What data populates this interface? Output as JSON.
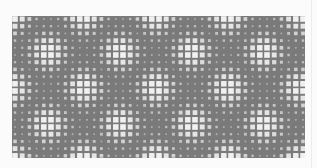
{
  "image": {
    "subject": "moire-dot-pattern",
    "description": "Grid of light dots on gray background forming diamond interference pattern",
    "colors": {
      "page_background": "#fbfbfb",
      "pattern_background": "#7a7a7a",
      "dot_color": "#f4f4f4",
      "dark_shade": "#5a5a5a"
    }
  }
}
